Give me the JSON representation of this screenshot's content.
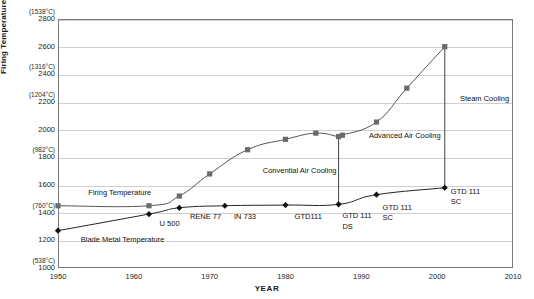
{
  "chart_data": {
    "type": "line",
    "title": "",
    "xlabel": "YEAR",
    "ylabel": "Firing Temperature °F (°C)",
    "xlim": [
      1950,
      2010
    ],
    "ylim": [
      1000,
      2800
    ],
    "grid": true,
    "legend_position": "inline-annotations",
    "xticks": [
      "1950",
      "1960",
      "1970",
      "1980",
      "1990",
      "2000",
      "2010"
    ],
    "xtick_values": [
      1950,
      1960,
      1970,
      1980,
      1990,
      2000,
      2010
    ],
    "yticks": [
      "1000",
      "1200",
      "1400",
      "1600",
      "1800",
      "2000",
      "2200",
      "2400",
      "2600",
      "2800"
    ],
    "ytick_values": [
      1000,
      1200,
      1400,
      1600,
      1800,
      2000,
      2200,
      2400,
      2600,
      2800
    ],
    "celsius_annotations": [
      {
        "fahrenheit": 2800,
        "label": "(1538°C)"
      },
      {
        "fahrenheit": 2400,
        "label": "(1316°C)"
      },
      {
        "fahrenheit": 2200,
        "label": "(1204°C)"
      },
      {
        "fahrenheit": 1800,
        "label": "(982°C)"
      },
      {
        "fahrenheit": 1400,
        "label": "(760°C)"
      },
      {
        "fahrenheit": 1000,
        "label": "(538°C)"
      }
    ],
    "series": [
      {
        "name": "Firing Temperature",
        "marker": "square",
        "color": "#555555",
        "x": [
          1950,
          1962,
          1966,
          1970,
          1975,
          1980,
          1984,
          1987,
          1987.5,
          1992,
          1996,
          2001
        ],
        "values": [
          1450,
          1450,
          1520,
          1680,
          1855,
          1930,
          1975,
          1950,
          1960,
          2055,
          2300,
          2600
        ]
      },
      {
        "name": "Blade Metal Temperature",
        "marker": "diamond",
        "color": "#222222",
        "x": [
          1950,
          1962,
          1966,
          1972,
          1980,
          1987,
          1992,
          2001
        ],
        "values": [
          1270,
          1390,
          1435,
          1450,
          1455,
          1460,
          1530,
          1580
        ]
      }
    ],
    "connectors": [
      {
        "x": 1987,
        "y_top": 1950,
        "y_bottom": 1460
      },
      {
        "x": 2001,
        "y_top": 2600,
        "y_bottom": 1580
      }
    ],
    "region_labels": [
      {
        "text": "Convential Air Cooling",
        "x": 1977,
        "y": 1700
      },
      {
        "text": "Advanced Air Cooling",
        "x": 1991,
        "y": 1955
      },
      {
        "text": "Steam Cooling",
        "x": 2003,
        "y": 2220
      }
    ],
    "series_labels": [
      {
        "text": "Firing Temperature",
        "x": 1954,
        "y": 1545
      },
      {
        "text": "Blade Metal Temperature",
        "x": 1953,
        "y": 1205
      }
    ],
    "point_labels": [
      {
        "text": "U 500",
        "x": 1963.4,
        "y": 1320
      },
      {
        "text": "RENE 77",
        "x": 1967.4,
        "y": 1370
      },
      {
        "text": "IN 733",
        "x": 1973.2,
        "y": 1372
      },
      {
        "text": "GTD111",
        "x": 1981.2,
        "y": 1372
      },
      {
        "text": "GTD 111",
        "x": 1987.5,
        "y": 1373
      },
      {
        "text": "DS",
        "x": 1987.5,
        "y": 1300
      },
      {
        "text": "GTD 111",
        "x": 1992.8,
        "y": 1432
      },
      {
        "text": "SC",
        "x": 1992.8,
        "y": 1360
      },
      {
        "text": "GTD 111",
        "x": 2001.8,
        "y": 1550
      },
      {
        "text": "SC",
        "x": 2001.8,
        "y": 1478
      }
    ]
  }
}
